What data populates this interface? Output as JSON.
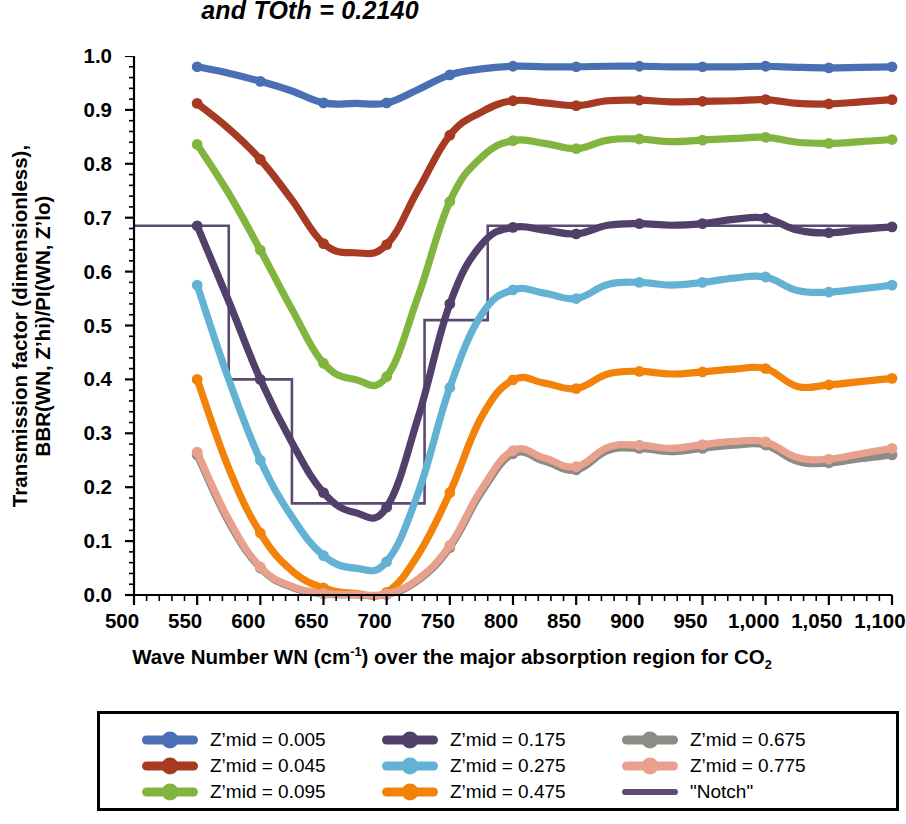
{
  "chart_data": {
    "type": "line",
    "title": "and TOth = 0.2140",
    "xlabel_parts": {
      "pre": "Wave Number WN (cm",
      "sup": "-1",
      "mid": ") over the major absorption region for CO",
      "sub": "2"
    },
    "xlabel": "Wave Number WN (cm-1) over the major absorption region for CO2",
    "ylabel_line1": "Transmission factor (dimensionless),",
    "ylabel_line2": "BBR(WN, Z’hi)/PI(WN, Z’lo)",
    "ylabel": "Transmission factor (dimensionless), BBR(WN, Z’hi)/PI(WN, Z’lo)",
    "xlim": [
      500,
      1100
    ],
    "ylim": [
      0.0,
      1.0
    ],
    "x_major_step": 50,
    "x_minor_step": 10,
    "y_major_step": 0.1,
    "y_minor_step": 0.02,
    "grid": false,
    "legend_position": "bottom",
    "xtick_labels": [
      "500",
      "550",
      "600",
      "650",
      "700",
      "750",
      "800",
      "850",
      "900",
      "950",
      "1,000",
      "1,050",
      "1,100"
    ],
    "xtick_values": [
      500,
      550,
      600,
      650,
      700,
      750,
      800,
      850,
      900,
      950,
      1000,
      1050,
      1100
    ],
    "ytick_labels": [
      "0.0",
      "0.1",
      "0.2",
      "0.3",
      "0.4",
      "0.5",
      "0.6",
      "0.7",
      "0.8",
      "0.9",
      "1.0"
    ],
    "ytick_values": [
      0.0,
      0.1,
      0.2,
      0.3,
      0.4,
      0.5,
      0.6,
      0.7,
      0.8,
      0.9,
      1.0
    ],
    "x": [
      550,
      575,
      600,
      625,
      650,
      675,
      700,
      725,
      750,
      775,
      800,
      825,
      850,
      875,
      900,
      925,
      950,
      975,
      1000,
      1025,
      1050,
      1075,
      1100
    ],
    "series": [
      {
        "name": "Z’mid = 0.005",
        "label": "Z’mid = 0.005",
        "color": "#4A6FB5",
        "values": [
          0.98,
          0.968,
          0.953,
          0.935,
          0.913,
          0.912,
          0.913,
          0.938,
          0.965,
          0.976,
          0.981,
          0.98,
          0.98,
          0.981,
          0.981,
          0.98,
          0.98,
          0.98,
          0.981,
          0.979,
          0.978,
          0.979,
          0.98
        ]
      },
      {
        "name": "Z’mid = 0.045",
        "label": "Z’mid = 0.045",
        "color": "#A63A23",
        "values": [
          0.912,
          0.865,
          0.808,
          0.733,
          0.652,
          0.635,
          0.65,
          0.752,
          0.853,
          0.896,
          0.917,
          0.913,
          0.908,
          0.917,
          0.918,
          0.915,
          0.916,
          0.917,
          0.919,
          0.912,
          0.911,
          0.915,
          0.919
        ]
      },
      {
        "name": "Z’mid = 0.095",
        "label": "Z’mid = 0.095",
        "color": "#82B53F",
        "values": [
          0.836,
          0.745,
          0.64,
          0.53,
          0.43,
          0.4,
          0.405,
          0.555,
          0.73,
          0.812,
          0.843,
          0.838,
          0.828,
          0.844,
          0.846,
          0.841,
          0.844,
          0.847,
          0.849,
          0.84,
          0.838,
          0.841,
          0.845
        ]
      },
      {
        "name": "Z’mid = 0.175",
        "label": "Z’mid = 0.175",
        "color": "#51406A",
        "values": [
          0.685,
          0.545,
          0.4,
          0.283,
          0.19,
          0.153,
          0.163,
          0.33,
          0.54,
          0.65,
          0.682,
          0.677,
          0.67,
          0.686,
          0.689,
          0.686,
          0.689,
          0.697,
          0.699,
          0.677,
          0.672,
          0.678,
          0.683
        ]
      },
      {
        "name": "Z’mid = 0.275",
        "label": "Z’mid = 0.275",
        "color": "#63B2D4",
        "values": [
          0.575,
          0.4,
          0.25,
          0.145,
          0.073,
          0.05,
          0.062,
          0.19,
          0.385,
          0.52,
          0.566,
          0.56,
          0.55,
          0.576,
          0.58,
          0.575,
          0.58,
          0.588,
          0.59,
          0.565,
          0.562,
          0.568,
          0.575
        ]
      },
      {
        "name": "Z’mid = 0.475",
        "label": "Z’mid = 0.475",
        "color": "#F2820A",
        "values": [
          0.4,
          0.235,
          0.115,
          0.045,
          0.013,
          0.003,
          0.005,
          0.075,
          0.19,
          0.33,
          0.399,
          0.393,
          0.383,
          0.41,
          0.415,
          0.41,
          0.414,
          0.419,
          0.42,
          0.387,
          0.39,
          0.396,
          0.402
        ]
      },
      {
        "name": "Z’mid = 0.675",
        "label": "Z’mid = 0.675",
        "color": "#8C8B85",
        "values": [
          0.26,
          0.135,
          0.05,
          0.014,
          0.002,
          0.0,
          0.001,
          0.027,
          0.088,
          0.19,
          0.262,
          0.248,
          0.232,
          0.268,
          0.272,
          0.266,
          0.272,
          0.278,
          0.278,
          0.248,
          0.245,
          0.253,
          0.26
        ]
      },
      {
        "name": "Z’mid = 0.775",
        "label": "Z’mid = 0.775",
        "color": "#E8A18C",
        "values": [
          0.265,
          0.14,
          0.052,
          0.016,
          0.003,
          0.001,
          0.002,
          0.03,
          0.092,
          0.196,
          0.268,
          0.254,
          0.238,
          0.274,
          0.278,
          0.272,
          0.279,
          0.285,
          0.284,
          0.255,
          0.252,
          0.262,
          0.272
        ]
      }
    ],
    "notch": {
      "name": "\"Notch\"",
      "label": "\"Notch\"",
      "color": "#5C4A73",
      "style": "step",
      "steps": [
        {
          "x_start": 500,
          "x_end": 575,
          "y": 0.685
        },
        {
          "x_start": 575,
          "x_end": 625,
          "y": 0.4
        },
        {
          "x_start": 625,
          "x_end": 730,
          "y": 0.17
        },
        {
          "x_start": 730,
          "x_end": 780,
          "y": 0.51
        },
        {
          "x_start": 780,
          "x_end": 1100,
          "y": 0.685
        }
      ]
    }
  },
  "legend": {
    "columns": [
      [
        {
          "label": "Z’mid = 0.005",
          "color": "#4A6FB5",
          "style": "marker-line"
        },
        {
          "label": "Z’mid = 0.045",
          "color": "#A63A23",
          "style": "marker-line"
        },
        {
          "label": "Z’mid = 0.095",
          "color": "#82B53F",
          "style": "marker-line"
        }
      ],
      [
        {
          "label": "Z’mid = 0.175",
          "color": "#51406A",
          "style": "marker-line"
        },
        {
          "label": "Z’mid = 0.275",
          "color": "#63B2D4",
          "style": "marker-line"
        },
        {
          "label": "Z’mid = 0.475",
          "color": "#F2820A",
          "style": "marker-line"
        }
      ],
      [
        {
          "label": "Z’mid = 0.675",
          "color": "#8C8B85",
          "style": "marker-line"
        },
        {
          "label": "Z’mid = 0.775",
          "color": "#E8A18C",
          "style": "marker-line"
        },
        {
          "label": "\"Notch\"",
          "color": "#5C4A73",
          "style": "plain-line"
        }
      ]
    ]
  }
}
